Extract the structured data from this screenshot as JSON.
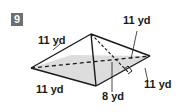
{
  "problem": {
    "number": "9"
  },
  "figure": {
    "type": "square pyramid",
    "labels": {
      "slant_edge": "11 yd",
      "base_back": "11 yd",
      "base_front_left": "11 yd",
      "base_front_right": "11 yd",
      "slant_height": "8 yd"
    },
    "colors": {
      "badge": "#6d6e71",
      "face_shading": "#d9d9d9",
      "stroke": "#1a1a1a"
    }
  }
}
